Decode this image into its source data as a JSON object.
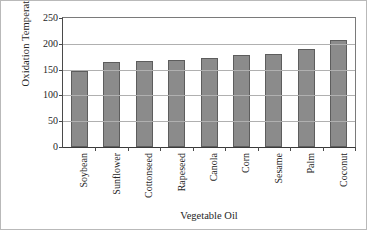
{
  "chart_data": {
    "type": "bar",
    "title": "",
    "xlabel": "Vegetable Oil",
    "ylabel": "Oxidation Temperature (°C)",
    "categories": [
      "Soybean",
      "Sunflower",
      "Cottonseed",
      "Rapeseed",
      "Canola",
      "Corn",
      "Sesame",
      "Palm",
      "Coconut"
    ],
    "values": [
      148,
      164,
      166,
      168,
      172,
      178,
      180,
      190,
      207
    ],
    "ylim": [
      0,
      250
    ],
    "yticks": [
      0,
      50,
      100,
      150,
      200,
      250
    ],
    "ytick_labels": [
      "0",
      "50",
      "100",
      "150",
      "200",
      "250"
    ],
    "grid": "horizontal",
    "legend": "none",
    "series_color": "#8b8b8b",
    "series_edge_color": "#5d5d5d",
    "gridline_color": "#b0b0b0",
    "axis_color": "#4a4a4a",
    "background": "#ffffff"
  }
}
